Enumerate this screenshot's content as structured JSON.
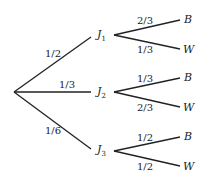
{
  "root": {
    "x": 14,
    "y": 92
  },
  "first_level": [
    {
      "node": "J",
      "sub": "1",
      "prob": "1/2"
    },
    {
      "node": "J",
      "sub": "2",
      "prob": "1/3"
    },
    {
      "node": "J",
      "sub": "3",
      "prob": "1/6"
    }
  ],
  "second_level": [
    {
      "parent": "J1",
      "branches": [
        {
          "outcome": "B",
          "prob": "2/3"
        },
        {
          "outcome": "W",
          "prob": "1/3"
        }
      ]
    },
    {
      "parent": "J2",
      "branches": [
        {
          "outcome": "B",
          "prob": "1/3"
        },
        {
          "outcome": "W",
          "prob": "2/3"
        }
      ]
    },
    {
      "parent": "J3",
      "branches": [
        {
          "outcome": "B",
          "prob": "1/2"
        },
        {
          "outcome": "W",
          "prob": "1/2"
        }
      ]
    }
  ]
}
